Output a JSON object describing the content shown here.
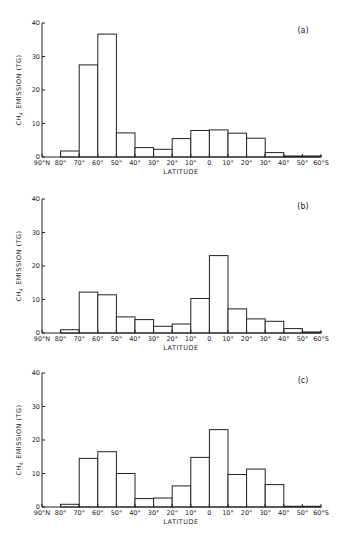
{
  "chart_data": [
    {
      "type": "bar",
      "panel": "(a)",
      "title": "",
      "xlabel": "LATITUDE",
      "ylabel": "CH4 EMISSION (TG)",
      "ylim": [
        0,
        40
      ],
      "yticks": [
        0,
        10,
        20,
        30,
        40
      ],
      "xtick_labels": [
        "90°N",
        "80°",
        "70°",
        "60°",
        "50°",
        "40°",
        "30°",
        "20°",
        "10°",
        "0",
        "10°",
        "20°",
        "30°",
        "40°",
        "50°",
        "60°S"
      ],
      "categories": [
        "90-80N",
        "80-70N",
        "70-60N",
        "60-50N",
        "50-40N",
        "40-30N",
        "30-20N",
        "20-10N",
        "10-0N",
        "0-10S",
        "10-20S",
        "20-30S",
        "30-40S",
        "40-50S",
        "50-60S"
      ],
      "values": [
        0,
        1.8,
        27.5,
        36.7,
        7.2,
        2.8,
        2.3,
        5.5,
        7.9,
        8.1,
        7.1,
        5.6,
        1.3,
        0.3,
        0.3
      ],
      "grid": false
    },
    {
      "type": "bar",
      "panel": "(b)",
      "title": "",
      "xlabel": "LATITUDE",
      "ylabel": "CH4 EMISSION (TG)",
      "ylim": [
        0,
        40
      ],
      "yticks": [
        0,
        10,
        20,
        30,
        40
      ],
      "xtick_labels": [
        "90°N",
        "80°",
        "70°",
        "60°",
        "50°",
        "40°",
        "30°",
        "20°",
        "10°",
        "0",
        "10°",
        "20°",
        "30°",
        "40°",
        "50°",
        "60°S"
      ],
      "categories": [
        "90-80N",
        "80-70N",
        "70-60N",
        "60-50N",
        "50-40N",
        "40-30N",
        "30-20N",
        "20-10N",
        "10-0N",
        "0-10S",
        "10-20S",
        "20-30S",
        "30-40S",
        "40-50S",
        "50-60S"
      ],
      "values": [
        0,
        1.0,
        12.2,
        11.4,
        4.8,
        4.0,
        2.0,
        2.7,
        10.3,
        23.1,
        7.2,
        4.2,
        3.5,
        1.3,
        0.3
      ],
      "grid": false
    },
    {
      "type": "bar",
      "panel": "(c)",
      "title": "",
      "xlabel": "LATITUDE",
      "ylabel": "CH4 EMISSION (TG)",
      "ylim": [
        0,
        40
      ],
      "yticks": [
        0,
        10,
        20,
        30,
        40
      ],
      "xtick_labels": [
        "90°N",
        "80°",
        "70°",
        "60°",
        "50°",
        "40°",
        "30°",
        "20°",
        "10°",
        "0",
        "10°",
        "20°",
        "30°",
        "40°",
        "50°",
        "60°S"
      ],
      "categories": [
        "90-80N",
        "80-70N",
        "70-60N",
        "60-50N",
        "50-40N",
        "40-30N",
        "30-20N",
        "20-10N",
        "10-0N",
        "0-10S",
        "10-20S",
        "20-30S",
        "30-40S",
        "40-50S",
        "50-60S"
      ],
      "values": [
        0,
        0.8,
        14.5,
        16.5,
        10.0,
        2.5,
        2.7,
        6.3,
        14.8,
        23.1,
        9.7,
        11.3,
        6.7,
        0.2,
        0.2
      ],
      "grid": false
    }
  ],
  "labels": {
    "ylabel_main": "CH",
    "ylabel_sub": "4",
    "ylabel_rest": " EMISSION (TG)",
    "xlabel": "LATITUDE",
    "panel_a": "(a)",
    "panel_b": "(b)",
    "panel_c": "(c)"
  }
}
